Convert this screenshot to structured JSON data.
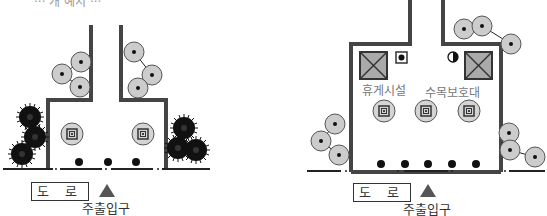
{
  "top_caption_partial": "··· 개 예시 ···",
  "left_diagram": {
    "road_label": "도 로",
    "entrance_label": "주출입구",
    "entrance_marker": "triangle-up",
    "bollard_count": 3,
    "planter_count": 2
  },
  "right_diagram": {
    "road_label": "도 로",
    "entrance_label": "주출입구",
    "entrance_marker": "triangle-up",
    "rest_facility_label": "휴게시설",
    "tree_protection_label": "수목보호대",
    "bollard_count": 5,
    "planter_count": 3
  },
  "colors": {
    "wall": "#444444",
    "tree_fill": "#cccccc",
    "marker": "#555555",
    "text": "#333333"
  }
}
